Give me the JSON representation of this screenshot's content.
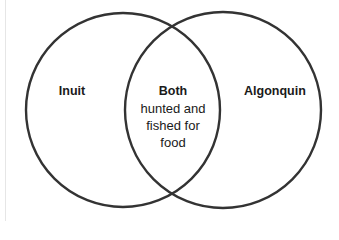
{
  "diagram": {
    "type": "venn",
    "colors": {
      "stroke": "#333333",
      "fill": "#ffffff",
      "text": "#1a1a1a"
    },
    "circles": [
      {
        "id": "left",
        "label": "Inuit",
        "cx": 123,
        "cy": 110,
        "r": 97
      },
      {
        "id": "right",
        "label": "Algonquin",
        "cx": 223,
        "cy": 110,
        "r": 98
      }
    ],
    "intersection": {
      "title": "Both",
      "lines": [
        "hunted and",
        "fished for",
        "food"
      ]
    }
  }
}
